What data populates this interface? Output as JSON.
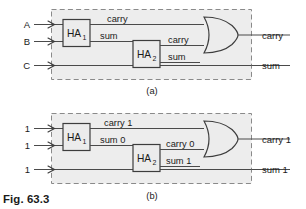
{
  "figure": {
    "caption": "Fig. 63.3",
    "panels": [
      {
        "id": "a",
        "label": "(a)",
        "description": "Generic full adder built from two half adders and an OR gate",
        "inputs": [
          {
            "name": "input-a",
            "label": "A"
          },
          {
            "name": "input-b",
            "label": "B"
          },
          {
            "name": "input-c",
            "label": "C"
          }
        ],
        "blocks": [
          {
            "name": "half-adder-1",
            "label": "HA",
            "subscript": "1"
          },
          {
            "name": "half-adder-2",
            "label": "HA",
            "subscript": "2"
          }
        ],
        "gates": [
          {
            "name": "or-gate",
            "type": "or"
          }
        ],
        "wire_labels": [
          {
            "name": "ha1-carry-label",
            "label": "carry"
          },
          {
            "name": "ha1-sum-label",
            "label": "sum"
          },
          {
            "name": "ha2-carry-label",
            "label": "carry"
          },
          {
            "name": "ha2-sum-label",
            "label": "sum"
          }
        ],
        "outputs": [
          {
            "name": "output-carry",
            "label": "carry"
          },
          {
            "name": "output-sum",
            "label": "sum"
          }
        ]
      },
      {
        "id": "b",
        "label": "(b)",
        "description": "Same circuit annotated with logic levels for inputs 1, 1, 1",
        "inputs": [
          {
            "name": "input-a",
            "label": "1"
          },
          {
            "name": "input-b",
            "label": "1"
          },
          {
            "name": "input-c",
            "label": "1"
          }
        ],
        "blocks": [
          {
            "name": "half-adder-1",
            "label": "HA",
            "subscript": "1"
          },
          {
            "name": "half-adder-2",
            "label": "HA",
            "subscript": "2"
          }
        ],
        "gates": [
          {
            "name": "or-gate",
            "type": "or"
          }
        ],
        "wire_labels": [
          {
            "name": "ha1-carry-label",
            "label": "carry 1"
          },
          {
            "name": "ha1-sum-label",
            "label": "sum 0"
          },
          {
            "name": "ha2-carry-label",
            "label": "carry 0"
          },
          {
            "name": "ha2-sum-label",
            "label": "sum 1"
          }
        ],
        "outputs": [
          {
            "name": "output-carry",
            "label": "carry 1"
          },
          {
            "name": "output-sum",
            "label": "sum 1"
          }
        ]
      }
    ]
  },
  "colors": {
    "page_background": "#ffffff",
    "panel_fill": "#ededed",
    "panel_border": "#8a8a8a",
    "block_fill": "#ececec",
    "block_border": "#3d3d3d",
    "wire": "#4a4a4a",
    "text": "#1a1a1a"
  }
}
